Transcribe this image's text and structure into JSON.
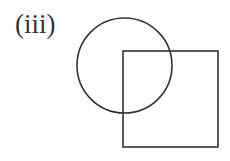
{
  "label": "(iii)",
  "shapes": {
    "circle": {
      "cx": 124.5,
      "cy": 65.5,
      "r": 47.5,
      "stroke": "#333333",
      "stroke_width": 1.6
    },
    "square": {
      "x": 123,
      "y": 51,
      "width": 95,
      "height": 96,
      "stroke": "#333333",
      "stroke_width": 1.6
    }
  }
}
